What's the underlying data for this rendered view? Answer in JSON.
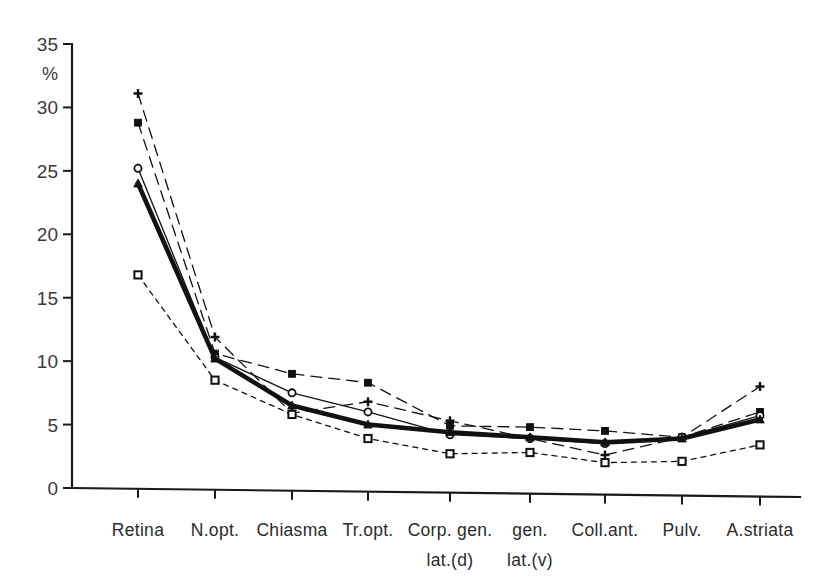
{
  "chart_data": {
    "type": "line",
    "title": "",
    "xlabel": "",
    "ylabel": "%",
    "ylim": [
      0,
      35
    ],
    "yticks": [
      0,
      5,
      10,
      15,
      20,
      25,
      30,
      35
    ],
    "ytick_labels": [
      "0",
      "5",
      "10",
      "15",
      "20",
      "25",
      "30",
      "35"
    ],
    "grid": false,
    "legend": "none",
    "categories": [
      "Retina",
      "N.opt.",
      "Chiasma",
      "Tr.opt.",
      "Corp. gen.",
      "gen.",
      "Coll.ant.",
      "Pulv.",
      "A.striata"
    ],
    "category_labels": [
      {
        "line1": "Retina",
        "line2": ""
      },
      {
        "line1": "N.opt.",
        "line2": ""
      },
      {
        "line1": "Chiasma",
        "line2": ""
      },
      {
        "line1": "Tr.opt.",
        "line2": ""
      },
      {
        "line1": "Corp. gen.",
        "line2": "lat.(d)"
      },
      {
        "line1": "gen.",
        "line2": "lat.(v)"
      },
      {
        "line1": "Coll.ant.",
        "line2": ""
      },
      {
        "line1": "Pulv.",
        "line2": ""
      },
      {
        "line1": "A.striata",
        "line2": ""
      }
    ],
    "series": [
      {
        "name": "series-plus",
        "marker": "plus",
        "style": "dashed-long",
        "emphasis": false,
        "values": [
          31.1,
          11.9,
          5.9,
          6.8,
          5.3,
          3.9,
          2.6,
          4.0,
          8.0
        ]
      },
      {
        "name": "series-filled-square",
        "marker": "filled-square",
        "style": "dashed-long",
        "emphasis": false,
        "values": [
          28.8,
          10.6,
          9.0,
          8.3,
          4.9,
          4.8,
          4.5,
          4.0,
          6.0
        ]
      },
      {
        "name": "series-open-circle",
        "marker": "open-circle",
        "style": "solid-thin",
        "emphasis": false,
        "values": [
          25.2,
          10.3,
          7.5,
          6.0,
          4.2,
          3.9,
          3.5,
          4.0,
          5.7
        ]
      },
      {
        "name": "series-filled-triangle",
        "marker": "filled-triangle",
        "style": "thick",
        "emphasis": true,
        "values": [
          24.0,
          10.2,
          6.5,
          5.0,
          4.4,
          4.0,
          3.6,
          3.9,
          5.4
        ]
      },
      {
        "name": "series-open-square",
        "marker": "open-square",
        "style": "dotted",
        "emphasis": false,
        "values": [
          16.8,
          8.5,
          5.8,
          3.9,
          2.7,
          2.8,
          2.0,
          2.1,
          3.4
        ]
      }
    ],
    "axis_geometry": {
      "x_positions": [
        138,
        215,
        292,
        368,
        450,
        530,
        605,
        682,
        760
      ],
      "y_zero_px": 488,
      "y_max_px": 44,
      "axis_x_px": 72,
      "axis_bottom_left_px": 72,
      "axis_bottom_right_px": 800
    }
  }
}
